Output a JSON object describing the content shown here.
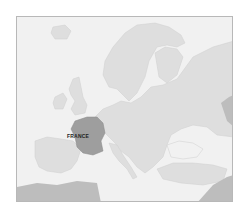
{
  "map": {
    "title": "Europe",
    "highlighted_country": {
      "name": "France",
      "label": "FRANCE",
      "color": "#9e9e9e"
    },
    "colors": {
      "sea": "#f1f1f1",
      "land": "#dedede",
      "highlight": "#9e9e9e",
      "outside": "#bdbdbd",
      "border": "#b8b8b8"
    }
  }
}
